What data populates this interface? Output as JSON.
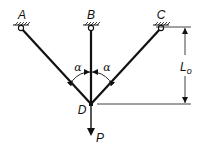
{
  "diagram": {
    "supports": [
      {
        "label": "A"
      },
      {
        "label": "B"
      },
      {
        "label": "C"
      }
    ],
    "joint_label": "D",
    "angle_labels": [
      "α",
      "α"
    ],
    "dimension_label": "L",
    "dimension_subscript": "o",
    "load_label": "P",
    "colors": {
      "stroke": "#111111",
      "background": "#ffffff"
    }
  }
}
